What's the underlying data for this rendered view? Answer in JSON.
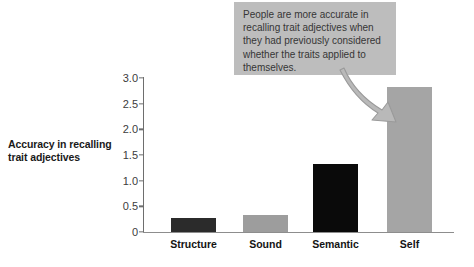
{
  "chart": {
    "ylabel": "Accuracy in recalling trait adjectives",
    "ylabel_line1": "Accuracy in recalling",
    "ylabel_line2": "trait adjectives",
    "annotation": "People are more accurate in recalling trait adjectives when they had previously considered whether the traits applied to themselves.",
    "colors": {
      "bar_dark": "#2b2b2b",
      "bar_black": "#0a0a0a",
      "bar_gray": "#a5a5a5",
      "bar_gray_light": "#9d9d9d",
      "callout_bg": "#bdbdbd",
      "callout_text": "#363636",
      "axis": "#6e6e6e"
    }
  },
  "chart_data": {
    "type": "bar",
    "title": "",
    "xlabel": "",
    "ylabel": "Accuracy in recalling trait adjectives",
    "categories": [
      "Structure",
      "Sound",
      "Semantic",
      "Self"
    ],
    "values": [
      0.27,
      0.33,
      1.32,
      2.82
    ],
    "bar_colors": [
      "#2b2b2b",
      "#9d9d9d",
      "#0a0a0a",
      "#a5a5a5"
    ],
    "ylim": [
      0,
      3.0
    ],
    "yticks": [
      "0",
      "0.5",
      "1.0",
      "1.5",
      "2.0",
      "2.5",
      "3.0"
    ],
    "ytick_values": [
      0,
      0.5,
      1.0,
      1.5,
      2.0,
      2.5,
      3.0
    ],
    "grid": false,
    "legend": false,
    "annotations": [
      {
        "text": "People are more accurate in recalling trait adjectives when they had previously considered whether the traits applied to themselves.",
        "points_to": "Self"
      }
    ]
  }
}
